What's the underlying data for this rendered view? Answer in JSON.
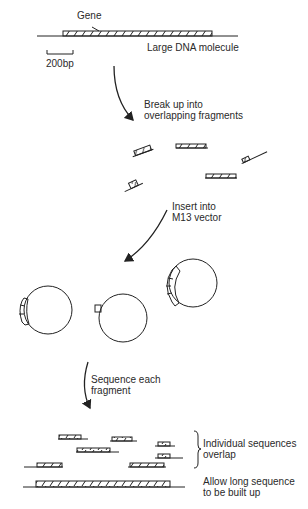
{
  "diagram": {
    "gene_label": "Gene",
    "dna_label": "Large DNA molecule",
    "scale_label": "200bp",
    "steps": [
      {
        "line1": "Break up into",
        "line2": "overlapping fragments"
      },
      {
        "line1": "Insert into",
        "line2": "M13 vector"
      },
      {
        "line1": "Sequence each",
        "line2": "fragment"
      }
    ],
    "overlap_label": {
      "line1": "Individual sequences",
      "line2": "overlap"
    },
    "assembly_label": {
      "line1": "Allow long sequence",
      "line2": "to be built up"
    },
    "colors": {
      "ink": "#222222",
      "background": "#ffffff"
    }
  }
}
